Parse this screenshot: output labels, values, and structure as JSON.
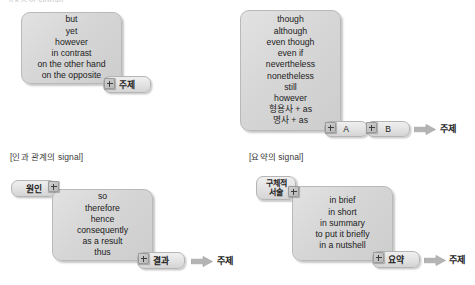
{
  "page": {
    "width": 475,
    "height": 285,
    "background": "#ffffff",
    "box_fill": "#d6d6d6",
    "box_border": "#b9b9b9",
    "tag_fill": "#e3e3e3",
    "arrow_fill": "#b0b0b0",
    "text_color": "#212121"
  },
  "sections": {
    "contrast": {
      "header": "[대조의 signal]",
      "words": [
        "but",
        "yet",
        "however",
        "in contrast",
        "on the other hand",
        "on the opposite"
      ],
      "plus_icon": "plus-icon",
      "tag": "주제"
    },
    "concession": {
      "header": "",
      "words": [
        "though",
        "although",
        "even though",
        "even if",
        "nevertheless",
        "nonetheless",
        "still",
        "however",
        "형용사 + as",
        "명사 + as"
      ],
      "plus_icon_1": "plus-icon",
      "pill_a": "A",
      "plus_icon_2": "plus-icon",
      "pill_b": "B",
      "arrow_icon": "right-arrow-icon",
      "result": "주제"
    },
    "causality": {
      "header": "[인과 관계의 signal]",
      "cause_tag": "원인",
      "plus_icon_1": "plus-icon",
      "words": [
        "so",
        "therefore",
        "hence",
        "consequently",
        "as a result",
        "thus"
      ],
      "plus_icon_2": "plus-icon",
      "effect_tag": "결과",
      "arrow_icon": "right-arrow-icon",
      "result": "주제"
    },
    "summary": {
      "header": "[요약의 signal]",
      "detail_tag_line1": "구체적",
      "detail_tag_line2": "서술",
      "plus_icon_1": "plus-icon",
      "words": [
        "in brief",
        "in short",
        "in summary",
        "to put it briefly",
        "in a nutshell"
      ],
      "plus_icon_2": "plus-icon",
      "summary_tag": "요약",
      "arrow_icon": "right-arrow-icon",
      "result": "주제"
    }
  }
}
